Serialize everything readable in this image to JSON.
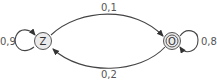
{
  "diagram": {
    "type": "state-transition",
    "nodes": [
      {
        "id": "Z",
        "label": "Z",
        "accepting": false
      },
      {
        "id": "O",
        "label": "O",
        "accepting": true
      }
    ],
    "edges": [
      {
        "from": "Z",
        "to": "Z",
        "label": "0,9"
      },
      {
        "from": "Z",
        "to": "O",
        "label": "0,1"
      },
      {
        "from": "O",
        "to": "Z",
        "label": "0,2"
      },
      {
        "from": "O",
        "to": "O",
        "label": "0,8"
      }
    ],
    "colors": {
      "stroke": "#444444",
      "node_fill": "#ebebeb",
      "text": "#555555"
    }
  }
}
